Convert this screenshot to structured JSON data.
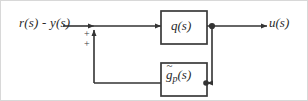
{
  "figure": {
    "kind": "control-block-diagram",
    "background_color": "#ffffff",
    "line_color": "#333333",
    "text_color": "#2a2a2a",
    "border_color": "#d8d8d8"
  },
  "labels": {
    "input_signal": "r(s) - y(s)",
    "output_signal": "u(s)",
    "plus_top": "+",
    "plus_bottom": "+"
  },
  "blocks": {
    "controller": {
      "label": "q(s)",
      "x": 160,
      "y": 10,
      "width": 46,
      "height": 33
    },
    "plant_model": {
      "label_base": "g",
      "label_accent": "~",
      "label_subscript": "p",
      "label_arg": "(s)",
      "label_full": "g̃p(s)",
      "x": 160,
      "y": 62,
      "width": 46,
      "height": 33
    }
  },
  "summing_junction": {
    "x": 93,
    "y": 25,
    "signs": [
      "+",
      "+"
    ]
  },
  "takeoff_node": {
    "x": 211,
    "y": 25
  },
  "signal_flow": [
    "r(s) - y(s) -> summing junction",
    "summing junction -> q(s)",
    "q(s) -> u(s)",
    "q(s) output node -> g~p(s)",
    "g~p(s) -> summing junction (positive feedback)"
  ]
}
